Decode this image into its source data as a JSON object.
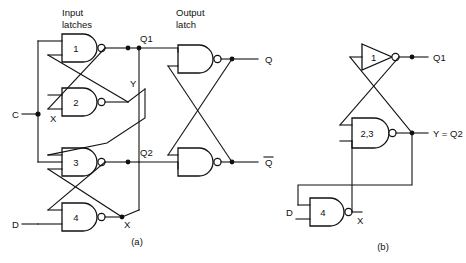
{
  "figure": {
    "title_a": "(a)",
    "title_b": "(b)",
    "captions": {
      "input_latches_l1": "Input",
      "input_latches_l2": "latches",
      "output_latch_l1": "Output",
      "output_latch_l2": "latch"
    }
  },
  "diagram_a": {
    "gates": [
      {
        "id": "g1",
        "label": "1",
        "type": "nand",
        "x": 62,
        "y": 34,
        "w": 38,
        "h": 28
      },
      {
        "id": "g2",
        "label": "2",
        "type": "nand",
        "x": 62,
        "y": 88,
        "w": 38,
        "h": 28
      },
      {
        "id": "g3",
        "label": "3",
        "type": "nand",
        "x": 62,
        "y": 148,
        "w": 38,
        "h": 28
      },
      {
        "id": "g4",
        "label": "4",
        "type": "nand",
        "x": 62,
        "y": 203,
        "w": 38,
        "h": 28
      },
      {
        "id": "g5",
        "label": "",
        "type": "nand",
        "x": 178,
        "y": 45,
        "w": 38,
        "h": 28
      },
      {
        "id": "g6",
        "label": "",
        "type": "nand",
        "x": 178,
        "y": 148,
        "w": 38,
        "h": 28
      }
    ],
    "inputs": [
      {
        "name": "C",
        "label": "C",
        "x": 14,
        "y": 114
      },
      {
        "name": "D",
        "label": "D",
        "x": 14,
        "y": 221
      }
    ],
    "outputs": [
      {
        "name": "Q",
        "label": "Q",
        "x": 243,
        "y": 59
      },
      {
        "name": "Qbar",
        "label": "Q",
        "overbar": true,
        "x": 243,
        "y": 162
      }
    ],
    "net_labels": [
      {
        "name": "Q1",
        "label": "Q1",
        "x": 140,
        "y": 40
      },
      {
        "name": "Q2",
        "label": "Q2",
        "x": 140,
        "y": 154
      },
      {
        "name": "Y",
        "label": "Y",
        "x": 131,
        "y": 87
      },
      {
        "name": "X-upper",
        "label": "X",
        "x": 53,
        "y": 119
      },
      {
        "name": "X-lower",
        "label": "X",
        "x": 124,
        "y": 222
      }
    ]
  },
  "diagram_b": {
    "gates": [
      {
        "id": "b1",
        "label": "1",
        "type": "inverter",
        "x": 360,
        "y": 44,
        "w": 34,
        "h": 26
      },
      {
        "id": "b23",
        "label": "2,3",
        "type": "nand",
        "x": 352,
        "y": 118,
        "w": 40,
        "h": 30
      },
      {
        "id": "b4",
        "label": "4",
        "type": "nand",
        "x": 308,
        "y": 198,
        "w": 36,
        "h": 28
      }
    ],
    "inputs": [
      {
        "name": "D",
        "label": "D",
        "x": 288,
        "y": 212
      }
    ],
    "net_labels": [
      {
        "name": "Q1",
        "label": "Q1",
        "x": 430,
        "y": 57
      },
      {
        "name": "Y-eq-Q2",
        "label": "Y = Q2",
        "x": 430,
        "y": 133
      },
      {
        "name": "X",
        "label": "X",
        "x": 358,
        "y": 218
      }
    ]
  },
  "colors": {
    "ink": "#111111",
    "paper": "#ffffff"
  }
}
